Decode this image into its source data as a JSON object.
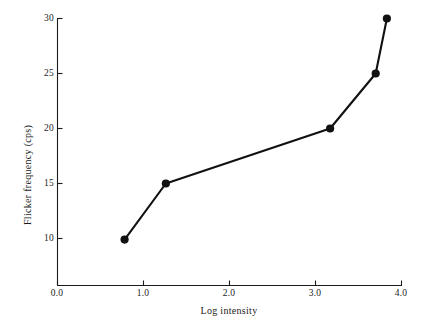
{
  "chart_data": {
    "type": "line",
    "title": "",
    "xlabel": "Log intensity",
    "ylabel": "Flicker frequency (cps)",
    "xlim": [
      0.0,
      4.0
    ],
    "ylim": [
      7.6,
      30.6
    ],
    "grid": false,
    "legend": null,
    "x_ticks": [
      {
        "value": 0.0,
        "label": "0.0"
      },
      {
        "value": 1.0,
        "label": "1.0"
      },
      {
        "value": 2.0,
        "label": "2.0"
      },
      {
        "value": 3.0,
        "label": "3.0"
      },
      {
        "value": 4.0,
        "label": "4.0"
      }
    ],
    "y_ticks": [
      {
        "value": 10,
        "label": "10"
      },
      {
        "value": 15,
        "label": "15"
      },
      {
        "value": 20,
        "label": "20"
      },
      {
        "value": 25,
        "label": "25"
      },
      {
        "value": 30,
        "label": "30"
      }
    ],
    "series": [
      {
        "name": "flicker-fusion",
        "color": "#111111",
        "marker": "filled-circle",
        "x": [
          0.78,
          1.26,
          3.17,
          3.7,
          3.83
        ],
        "y": [
          9.9,
          15.0,
          20.0,
          25.0,
          30.0
        ]
      }
    ]
  },
  "style": {
    "axis_color": "#1a1a1a",
    "line_color": "#111111",
    "marker_color": "#111111",
    "background": "#ffffff"
  }
}
